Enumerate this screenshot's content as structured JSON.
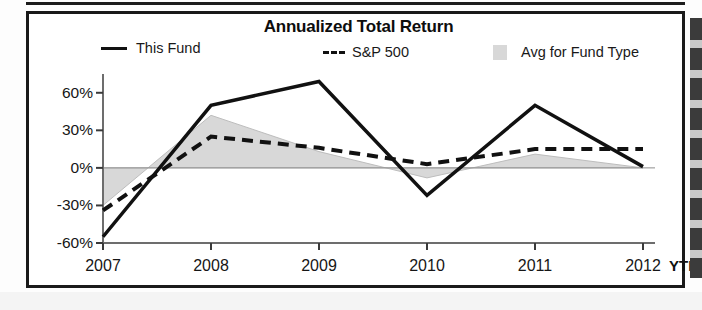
{
  "chart_data": {
    "type": "line",
    "title": "Annualized Total Return",
    "xlabel": "",
    "ylabel": "",
    "categories": [
      "2007",
      "2008",
      "2009",
      "2010",
      "2011",
      "2012"
    ],
    "x_tick_suffix_label": "YTD",
    "y_tick_labels": [
      "60%",
      "30%",
      "0%",
      "-30%",
      "-60%"
    ],
    "y_tick_values": [
      60,
      30,
      0,
      -30,
      -60
    ],
    "ylim": [
      -60,
      75
    ],
    "grid": false,
    "legend_position": "top",
    "series": [
      {
        "name": "This Fund",
        "style": "solid-line",
        "color": "#111111",
        "values": [
          -55,
          50,
          69,
          -22,
          50,
          1
        ]
      },
      {
        "name": "S&P 500",
        "style": "dashed-line",
        "color": "#111111",
        "values": [
          -34,
          25,
          16,
          3,
          15,
          15
        ]
      },
      {
        "name": "Avg for Fund Type",
        "style": "filled-area",
        "color": "#d8d8d8",
        "values": [
          -30,
          42,
          13,
          -8,
          11,
          0
        ]
      }
    ],
    "baseline_value": 0,
    "colors": {
      "this_fund": "#111111",
      "sp500": "#111111",
      "avg_fund_type": "#d8d8d8",
      "axis": "#5a5a5a",
      "frame": "#1a1a1a"
    }
  },
  "legend": {
    "items": [
      {
        "label": "This Fund",
        "icon": "solid-line-swatch"
      },
      {
        "label": "S&P 500",
        "icon": "dashed-line-swatch"
      },
      {
        "label": "Avg for Fund Type",
        "icon": "gray-box-swatch"
      }
    ]
  }
}
